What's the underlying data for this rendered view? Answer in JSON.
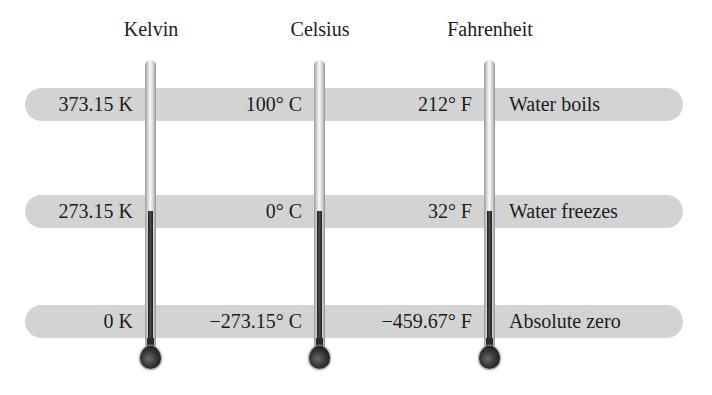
{
  "scales": [
    {
      "name": "Kelvin",
      "x": 150
    },
    {
      "name": "Celsius",
      "x": 320
    },
    {
      "name": "Fahrenheit",
      "x": 489
    }
  ],
  "rows": [
    {
      "event": "Water boils",
      "kelvin": "373.15 K",
      "celsius": "100° C",
      "fahrenheit": "212° F"
    },
    {
      "event": "Water freezes",
      "kelvin": "273.15 K",
      "celsius": "0° C",
      "fahrenheit": "32° F"
    },
    {
      "event": "Absolute zero",
      "kelvin": "0 K",
      "celsius": "−273.15° C",
      "fahrenheit": "−459.67° F"
    }
  ],
  "colors": {
    "band": "#d3d3d3",
    "mercury": "#2a2a2a",
    "tube": "#e9e9e9",
    "text": "#1c1c1c"
  }
}
